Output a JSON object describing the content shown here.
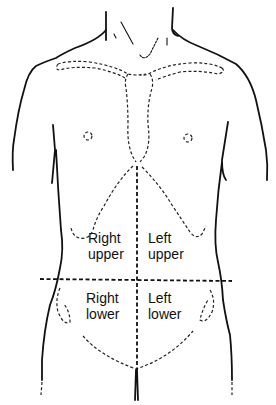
{
  "diagram": {
    "colors": {
      "line": "#111111",
      "background": "#ffffff"
    },
    "quadrants": {
      "right_upper": {
        "line1": "Right",
        "line2": "upper"
      },
      "left_upper": {
        "line1": "Left",
        "line2": "upper"
      },
      "right_lower": {
        "line1": "Right",
        "line2": "lower"
      },
      "left_lower": {
        "line1": "Left",
        "line2": "lower"
      }
    },
    "dividers": {
      "vertical_midline": {
        "x": 137,
        "y_from": 166,
        "y_to": 370
      },
      "horizontal_umbilical_line": {
        "y": 280,
        "x_from": 40,
        "x_to": 232
      }
    }
  }
}
